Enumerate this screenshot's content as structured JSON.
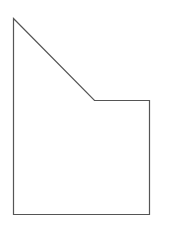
{
  "diagram": {
    "type": "polygon",
    "shape": "pentagon",
    "stroke_color": "#555555",
    "fill_color": "#ffffff",
    "stroke_width": 1.2,
    "vertices": [
      {
        "x": 13.5,
        "y": 18.5
      },
      {
        "x": 94.5,
        "y": 100.5
      },
      {
        "x": 149.5,
        "y": 100.5
      },
      {
        "x": 149.5,
        "y": 214.5
      },
      {
        "x": 13.5,
        "y": 214.5
      }
    ]
  }
}
